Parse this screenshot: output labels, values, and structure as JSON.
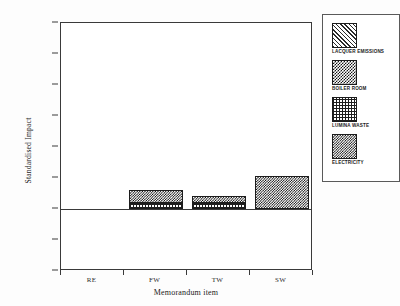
{
  "chart_data": {
    "type": "bar",
    "title": "",
    "xlabel": "Memorandum item",
    "ylabel": "Standardised Impact",
    "categories": [
      "RE",
      "FW",
      "TW",
      "SW"
    ],
    "ylim": [
      -10,
      30
    ],
    "yticks": [
      -10,
      -5,
      0,
      5,
      10,
      15,
      20,
      25,
      30
    ],
    "ytick_labels": [
      "-10",
      "-5",
      "0",
      "5",
      "10",
      "15",
      "20",
      "25",
      "30"
    ],
    "grid": false,
    "stacked": true,
    "legend_position": "right",
    "series": [
      {
        "name": "LACQUER EMISSIONS",
        "pattern": "diagonal-hatch",
        "values": [
          0,
          0,
          0,
          0
        ]
      },
      {
        "name": "BOILER ROOM",
        "pattern": "checkerboard",
        "values": [
          0,
          0,
          0,
          0
        ]
      },
      {
        "name": "LUMINA WASTE",
        "pattern": "fine-grid",
        "values": [
          0,
          1.0,
          1.0,
          0
        ]
      },
      {
        "name": "ELECTRICITY",
        "pattern": "dense-checker",
        "values": [
          0,
          2.1,
          1.1,
          5.4
        ]
      }
    ],
    "bar_totals": [
      0,
      3.1,
      2.1,
      5.4
    ],
    "annotations": []
  },
  "legend": {
    "items": [
      {
        "label": "LACQUER EMISSIONS",
        "pattern": "diagonal-hatch"
      },
      {
        "label": "BOILER ROOM",
        "pattern": "checkerboard"
      },
      {
        "label": "LUMINA WASTE",
        "pattern": "fine-grid"
      },
      {
        "label": "ELECTRICITY",
        "pattern": "dense-checker"
      }
    ]
  },
  "colors": {
    "axis": "#3a3a3a",
    "ink": "#1a1a1a",
    "background": "#ffffff"
  }
}
